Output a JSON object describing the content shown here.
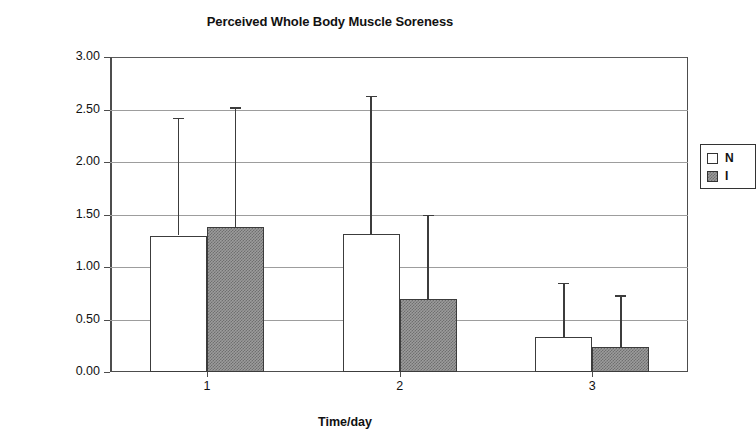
{
  "chart_data": {
    "type": "bar",
    "title": "Perceived Whole Body Muscle Soreness",
    "xlabel": "Time/day",
    "ylabel": "Muscle Soreness",
    "categories": [
      "1",
      "2",
      "3"
    ],
    "ylim": [
      0,
      3.0
    ],
    "ytick_step": 0.5,
    "ytick_labels": [
      "0.00",
      "0.50",
      "1.00",
      "1.50",
      "2.00",
      "2.50",
      "3.00"
    ],
    "ytick_values": [
      0,
      0.5,
      1.0,
      1.5,
      2.0,
      2.5,
      3.0
    ],
    "grid": true,
    "legend_position": "top-right",
    "series": [
      {
        "name": "N",
        "fill": "white",
        "values": [
          1.3,
          1.31,
          0.33
        ],
        "error_upper": [
          2.42,
          2.63,
          0.85
        ]
      },
      {
        "name": "I",
        "fill": "gray-hatched",
        "values": [
          1.38,
          0.7,
          0.24
        ],
        "error_upper": [
          2.52,
          1.5,
          0.73
        ]
      }
    ],
    "colors": {
      "series_n_fill": "#ffffff",
      "series_i_fill": "#9c9c9c",
      "bar_outline": "#3c3c3c",
      "gridline": "#9d9d9d",
      "axis": "#4d4d4d",
      "text": "#111111",
      "background": "#ffffff"
    }
  },
  "legend": {
    "entries": [
      {
        "label": "N"
      },
      {
        "label": "I"
      }
    ]
  }
}
